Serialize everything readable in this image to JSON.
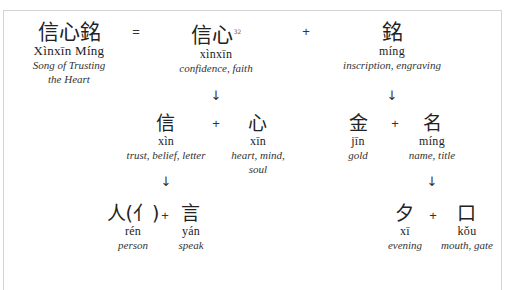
{
  "title": {
    "hanzi": "信心銘",
    "pinyin": "Xìnxīn Míng",
    "gloss_line1": "Song of Trusting",
    "gloss_line2": "the Heart"
  },
  "operators": {
    "equals": "=",
    "plus": "+",
    "arrow": "↓"
  },
  "level1": [
    {
      "hanzi": "信心",
      "footnote": "32",
      "pinyin": "xìnxīn",
      "gloss": "confidence, faith"
    },
    {
      "hanzi": "銘",
      "pinyin": "míng",
      "gloss": "inscription, engraving"
    }
  ],
  "level2": [
    {
      "hanzi": "信",
      "pinyin": "xìn",
      "gloss": "trust, belief, letter"
    },
    {
      "hanzi": "心",
      "pinyin": "xīn",
      "gloss_line1": "heart, mind,",
      "gloss_line2": "soul"
    },
    {
      "hanzi": "金",
      "pinyin": "jīn",
      "gloss": "gold"
    },
    {
      "hanzi": "名",
      "pinyin": "míng",
      "gloss": "name, title"
    }
  ],
  "level3": [
    {
      "hanzi": "人(亻)",
      "pinyin": "rén",
      "gloss": "person"
    },
    {
      "hanzi": "言",
      "pinyin": "yán",
      "gloss": "speak"
    },
    {
      "hanzi": "夕",
      "pinyin": "xī",
      "gloss": "evening"
    },
    {
      "hanzi": "口",
      "pinyin": "kǒu",
      "gloss": "mouth, gate"
    }
  ]
}
